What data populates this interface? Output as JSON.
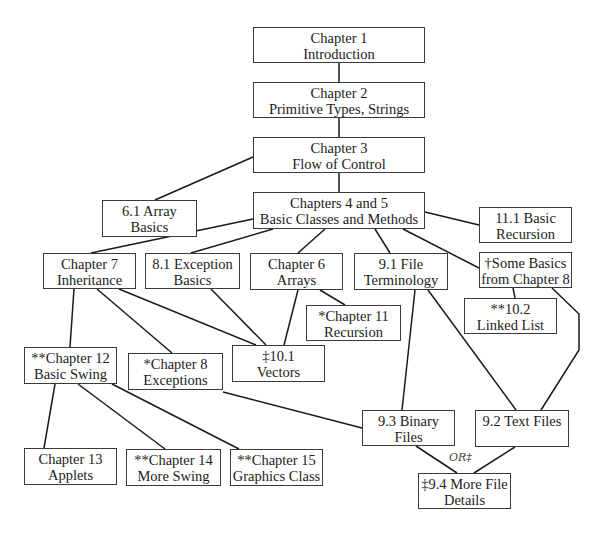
{
  "diagram": {
    "type": "chapter-dependency-flowchart",
    "nodes": [
      {
        "id": "ch1",
        "line1": "Chapter 1",
        "line2": "Introduction",
        "x": 253,
        "y": 27,
        "w": 172,
        "h": 36
      },
      {
        "id": "ch2",
        "line1": "Chapter 2",
        "line2": "Primitive Types, Strings",
        "x": 253,
        "y": 82,
        "w": 172,
        "h": 36
      },
      {
        "id": "ch3",
        "line1": "Chapter 3",
        "line2": "Flow of Control",
        "x": 253,
        "y": 137,
        "w": 172,
        "h": 36
      },
      {
        "id": "s61",
        "line1": "6.1 Array",
        "line2": "Basics",
        "x": 102,
        "y": 200,
        "w": 95,
        "h": 37
      },
      {
        "id": "ch45",
        "line1": "Chapters 4 and 5",
        "line2": "Basic Classes and Methods",
        "x": 253,
        "y": 192,
        "w": 172,
        "h": 37
      },
      {
        "id": "s111",
        "line1": "11.1 Basic",
        "line2": "Recursion",
        "x": 479,
        "y": 207,
        "w": 93,
        "h": 36
      },
      {
        "id": "ch7",
        "line1": "Chapter 7",
        "line2": "Inheritance",
        "x": 43,
        "y": 253,
        "w": 93,
        "h": 36
      },
      {
        "id": "s81",
        "line1": "8.1 Exception",
        "line2": "Basics",
        "x": 145,
        "y": 253,
        "w": 95,
        "h": 36
      },
      {
        "id": "ch6",
        "line1": "Chapter 6",
        "line2": "Arrays",
        "x": 250,
        "y": 253,
        "w": 93,
        "h": 37
      },
      {
        "id": "s91",
        "line1": "9.1 File",
        "line2": "Terminology",
        "x": 354,
        "y": 253,
        "w": 94,
        "h": 37
      },
      {
        "id": "some8",
        "line1": "†Some Basics",
        "line2": "from Chapter 8",
        "x": 479,
        "y": 252,
        "w": 93,
        "h": 36
      },
      {
        "id": "ch11",
        "line1": "*Chapter 11",
        "line2": "Recursion",
        "x": 306,
        "y": 305,
        "w": 95,
        "h": 36
      },
      {
        "id": "s102",
        "line1": "**10.2",
        "line2": "Linked List",
        "x": 464,
        "y": 298,
        "w": 93,
        "h": 36
      },
      {
        "id": "s101",
        "line1": "‡10.1",
        "line2": "Vectors",
        "x": 232,
        "y": 345,
        "w": 93,
        "h": 37
      },
      {
        "id": "ch12",
        "line1": "**Chapter 12",
        "line2": "Basic Swing",
        "x": 24,
        "y": 347,
        "w": 93,
        "h": 37
      },
      {
        "id": "ch8",
        "line1": "*Chapter 8",
        "line2": "Exceptions",
        "x": 128,
        "y": 353,
        "w": 95,
        "h": 37
      },
      {
        "id": "s93",
        "line1": "9.3 Binary",
        "line2": "Files",
        "x": 362,
        "y": 410,
        "w": 93,
        "h": 36
      },
      {
        "id": "s92",
        "line1": "9.2 Text Files",
        "line2": "",
        "x": 475,
        "y": 410,
        "w": 94,
        "h": 37
      },
      {
        "id": "ch13",
        "line1": "Chapter 13",
        "line2": "Applets",
        "x": 24,
        "y": 448,
        "w": 93,
        "h": 37
      },
      {
        "id": "ch14",
        "line1": "**Chapter 14",
        "line2": "More Swing",
        "x": 126,
        "y": 449,
        "w": 95,
        "h": 37
      },
      {
        "id": "ch15",
        "line1": "**Chapter 15",
        "line2": "Graphics Class",
        "x": 230,
        "y": 449,
        "w": 93,
        "h": 37
      },
      {
        "id": "s94",
        "line1": "‡9.4 More File",
        "line2": "Details",
        "x": 418,
        "y": 473,
        "w": 93,
        "h": 36
      }
    ],
    "edges": [
      {
        "from": "ch1",
        "to": "ch2",
        "points": [
          [
            339,
            63
          ],
          [
            339,
            82
          ]
        ]
      },
      {
        "from": "ch2",
        "to": "ch3",
        "points": [
          [
            339,
            118
          ],
          [
            339,
            137
          ]
        ]
      },
      {
        "from": "ch3",
        "to": "s61",
        "points": [
          [
            253,
            157
          ],
          [
            155,
            200
          ]
        ]
      },
      {
        "from": "ch3",
        "to": "ch45",
        "points": [
          [
            339,
            173
          ],
          [
            339,
            192
          ]
        ]
      },
      {
        "from": "ch45",
        "to": "s111",
        "points": [
          [
            425,
            212
          ],
          [
            479,
            225
          ]
        ]
      },
      {
        "from": "ch45",
        "to": "ch7",
        "points": [
          [
            253,
            219
          ],
          [
            91,
            253
          ]
        ]
      },
      {
        "from": "ch45",
        "to": "s81",
        "points": [
          [
            273,
            229
          ],
          [
            191,
            253
          ]
        ]
      },
      {
        "from": "ch45",
        "to": "ch6",
        "points": [
          [
            325,
            229
          ],
          [
            298,
            253
          ]
        ]
      },
      {
        "from": "ch45",
        "to": "s91",
        "points": [
          [
            375,
            229
          ],
          [
            390,
            253
          ]
        ]
      },
      {
        "from": "ch45",
        "to": "some8",
        "points": [
          [
            403,
            229
          ],
          [
            479,
            268
          ]
        ]
      },
      {
        "from": "ch7",
        "to": "ch12",
        "points": [
          [
            74,
            289
          ],
          [
            70,
            347
          ]
        ]
      },
      {
        "from": "ch7",
        "to": "ch8",
        "points": [
          [
            97,
            289
          ],
          [
            172,
            353
          ]
        ]
      },
      {
        "from": "ch7",
        "to": "s101",
        "points": [
          [
            119,
            289
          ],
          [
            256,
            345
          ]
        ]
      },
      {
        "from": "s81",
        "to": "s101",
        "points": [
          [
            211,
            289
          ],
          [
            266,
            345
          ]
        ]
      },
      {
        "from": "ch6",
        "to": "s101",
        "points": [
          [
            298,
            290
          ],
          [
            284,
            345
          ]
        ]
      },
      {
        "from": "ch6",
        "to": "ch11",
        "points": [
          [
            320,
            290
          ],
          [
            345,
            305
          ]
        ]
      },
      {
        "from": "s91",
        "to": "s93",
        "points": [
          [
            415,
            290
          ],
          [
            402,
            410
          ]
        ]
      },
      {
        "from": "s91",
        "to": "s92",
        "points": [
          [
            428,
            290
          ],
          [
            516,
            410
          ]
        ]
      },
      {
        "from": "some8",
        "to": "s102",
        "points": [
          [
            513,
            288
          ],
          [
            515,
            298
          ]
        ]
      },
      {
        "from": "some8",
        "to": "s92",
        "points": [
          [
            552,
            288
          ],
          [
            579,
            314
          ],
          [
            579,
            350
          ],
          [
            541,
            410
          ]
        ]
      },
      {
        "from": "ch8",
        "to": "s93",
        "points": [
          [
            223,
            392
          ],
          [
            362,
            428
          ]
        ]
      },
      {
        "from": "ch12",
        "to": "ch13",
        "points": [
          [
            55,
            384
          ],
          [
            44,
            448
          ]
        ]
      },
      {
        "from": "ch12",
        "to": "ch14",
        "points": [
          [
            78,
            384
          ],
          [
            165,
            449
          ]
        ]
      },
      {
        "from": "ch12",
        "to": "ch15",
        "points": [
          [
            112,
            384
          ],
          [
            239,
            449
          ]
        ]
      },
      {
        "from": "s93",
        "to": "s94",
        "points": [
          [
            416,
            446
          ],
          [
            457,
            473
          ]
        ]
      },
      {
        "from": "s92",
        "to": "s94",
        "points": [
          [
            515,
            447
          ],
          [
            474,
            473
          ]
        ]
      }
    ],
    "annotations": [
      {
        "id": "or-label",
        "text": "OR‡",
        "x": 449,
        "y": 451
      }
    ]
  }
}
